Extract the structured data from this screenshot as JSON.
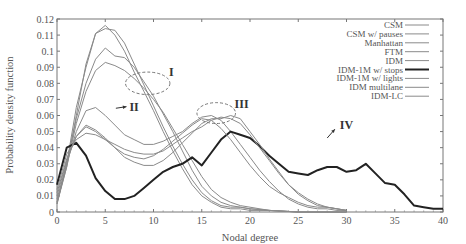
{
  "chart_data": {
    "type": "line",
    "title": "",
    "xlabel": "Nodal degree",
    "ylabel": "Probability density function",
    "xlim": [
      0,
      40
    ],
    "ylim": [
      0,
      0.12
    ],
    "xticks": [
      0,
      5,
      10,
      15,
      20,
      25,
      30,
      35,
      40
    ],
    "yticks": [
      0,
      0.01,
      0.02,
      0.03,
      0.04,
      0.05,
      0.06,
      0.07,
      0.08,
      0.09,
      0.1,
      0.11,
      0.12
    ],
    "xtick_labels": [
      "0",
      "5",
      "10",
      "15",
      "20",
      "25",
      "30",
      "35",
      "40"
    ],
    "ytick_labels": [
      "0",
      "0.01",
      "0.02",
      "0.03",
      "0.04",
      "0.05",
      "0.06",
      "0.07",
      "0.08",
      "0.09",
      "0.1",
      "0.11",
      "0.12"
    ],
    "grid": false,
    "legend_position": "upper right",
    "series": [
      {
        "name": "CSM",
        "color": "#8a8a8a",
        "width": 1,
        "x": [
          0,
          1,
          2,
          3,
          4,
          5,
          6,
          7,
          8,
          9,
          10,
          11,
          12,
          13,
          14,
          15,
          16,
          17,
          18,
          19,
          20,
          22,
          25,
          28,
          30
        ],
        "values": [
          0.005,
          0.03,
          0.065,
          0.09,
          0.111,
          0.116,
          0.11,
          0.1,
          0.087,
          0.075,
          0.063,
          0.05,
          0.038,
          0.027,
          0.017,
          0.01,
          0.006,
          0.003,
          0.002,
          0.002,
          0.001,
          0.001,
          0.0,
          0.0,
          0.0
        ]
      },
      {
        "name": "CSM w/ pauses",
        "color": "#8a8a8a",
        "width": 1,
        "x": [
          0,
          1,
          2,
          3,
          4,
          5,
          6,
          7,
          8,
          9,
          10,
          11,
          12,
          13,
          14,
          15,
          16,
          17,
          18,
          19,
          20,
          22,
          25,
          28,
          30
        ],
        "values": [
          0.005,
          0.028,
          0.06,
          0.092,
          0.111,
          0.114,
          0.113,
          0.105,
          0.092,
          0.079,
          0.066,
          0.053,
          0.041,
          0.03,
          0.02,
          0.012,
          0.007,
          0.004,
          0.003,
          0.003,
          0.002,
          0.001,
          0.0,
          0.0,
          0.0
        ]
      },
      {
        "name": "Manhattan",
        "color": "#8a8a8a",
        "width": 1,
        "x": [
          0,
          1,
          2,
          3,
          4,
          5,
          6,
          7,
          8,
          9,
          10,
          11,
          12,
          13,
          14,
          15,
          16,
          17,
          18,
          19,
          20,
          22,
          25,
          28,
          30
        ],
        "values": [
          0.006,
          0.03,
          0.058,
          0.08,
          0.095,
          0.102,
          0.097,
          0.096,
          0.09,
          0.081,
          0.072,
          0.061,
          0.05,
          0.038,
          0.026,
          0.016,
          0.01,
          0.006,
          0.004,
          0.003,
          0.002,
          0.001,
          0.0,
          0.0,
          0.0
        ]
      },
      {
        "name": "FTM",
        "color": "#8a8a8a",
        "width": 1,
        "x": [
          0,
          1,
          2,
          3,
          4,
          5,
          6,
          7,
          8,
          9,
          10,
          11,
          12,
          13,
          14,
          15,
          16,
          17,
          18,
          19,
          20,
          22,
          25,
          28,
          30
        ],
        "values": [
          0.006,
          0.028,
          0.055,
          0.075,
          0.088,
          0.093,
          0.091,
          0.088,
          0.083,
          0.077,
          0.07,
          0.062,
          0.052,
          0.042,
          0.032,
          0.022,
          0.014,
          0.009,
          0.006,
          0.004,
          0.003,
          0.001,
          0.0,
          0.0,
          0.0
        ]
      },
      {
        "name": "IDM",
        "color": "#8a8a8a",
        "width": 1,
        "x": [
          0,
          1,
          2,
          3,
          4,
          5,
          6,
          7,
          8,
          9,
          10,
          11,
          12,
          13,
          14,
          15,
          16,
          17,
          18,
          19,
          20,
          21,
          22,
          23,
          24,
          25,
          26,
          27,
          28,
          29,
          30
        ],
        "values": [
          0.008,
          0.03,
          0.05,
          0.063,
          0.065,
          0.06,
          0.054,
          0.048,
          0.045,
          0.042,
          0.042,
          0.044,
          0.047,
          0.05,
          0.055,
          0.059,
          0.06,
          0.057,
          0.05,
          0.042,
          0.034,
          0.026,
          0.019,
          0.013,
          0.008,
          0.005,
          0.003,
          0.002,
          0.002,
          0.001,
          0.001
        ]
      },
      {
        "name": "IDM-1M w/ stops",
        "color": "#222222",
        "width": 2,
        "x": [
          0,
          1,
          2,
          3,
          4,
          5,
          6,
          7,
          8,
          9,
          10,
          11,
          12,
          13,
          14,
          15,
          16,
          17,
          18,
          19,
          20,
          21,
          22,
          23,
          24,
          25,
          26,
          27,
          28,
          29,
          30,
          31,
          32,
          33,
          34,
          35,
          36,
          37,
          38,
          39,
          40
        ],
        "values": [
          0.017,
          0.04,
          0.043,
          0.035,
          0.021,
          0.013,
          0.008,
          0.008,
          0.01,
          0.015,
          0.02,
          0.025,
          0.028,
          0.03,
          0.034,
          0.029,
          0.037,
          0.045,
          0.05,
          0.048,
          0.046,
          0.041,
          0.035,
          0.03,
          0.025,
          0.024,
          0.023,
          0.026,
          0.028,
          0.028,
          0.025,
          0.026,
          0.03,
          0.024,
          0.018,
          0.017,
          0.011,
          0.004,
          0.003,
          0.002,
          0.002
        ]
      },
      {
        "name": "IDM-1M w/ lights",
        "color": "#8a8a8a",
        "width": 1,
        "x": [
          0,
          1,
          2,
          3,
          4,
          5,
          6,
          7,
          8,
          9,
          10,
          11,
          12,
          13,
          14,
          15,
          16,
          17,
          18,
          19,
          20,
          21,
          22,
          23,
          24,
          25,
          26,
          27,
          28,
          29,
          30
        ],
        "values": [
          0.01,
          0.032,
          0.047,
          0.053,
          0.05,
          0.045,
          0.04,
          0.036,
          0.034,
          0.033,
          0.035,
          0.039,
          0.044,
          0.049,
          0.054,
          0.058,
          0.057,
          0.052,
          0.045,
          0.037,
          0.029,
          0.022,
          0.016,
          0.012,
          0.009,
          0.006,
          0.004,
          0.003,
          0.003,
          0.002,
          0.001
        ]
      },
      {
        "name": "IDM multilane",
        "color": "#8a8a8a",
        "width": 1,
        "x": [
          0,
          1,
          2,
          3,
          4,
          5,
          6,
          7,
          8,
          9,
          10,
          11,
          12,
          13,
          14,
          15,
          16,
          17,
          18,
          19,
          20,
          21,
          22,
          23,
          24,
          25,
          26,
          27,
          28,
          29,
          30
        ],
        "values": [
          0.012,
          0.033,
          0.047,
          0.054,
          0.051,
          0.046,
          0.04,
          0.034,
          0.031,
          0.029,
          0.029,
          0.032,
          0.037,
          0.043,
          0.049,
          0.055,
          0.058,
          0.058,
          0.06,
          0.058,
          0.05,
          0.042,
          0.033,
          0.025,
          0.017,
          0.011,
          0.007,
          0.004,
          0.003,
          0.002,
          0.001
        ]
      },
      {
        "name": "IDM-LC",
        "color": "#8a8a8a",
        "width": 1,
        "x": [
          0,
          1,
          2,
          3,
          4,
          5,
          6,
          7,
          8,
          9,
          10,
          11,
          12,
          13,
          14,
          15,
          16,
          17,
          18,
          19,
          20,
          21,
          22,
          23,
          24,
          25,
          26,
          27,
          28,
          29,
          30
        ],
        "values": [
          0.014,
          0.036,
          0.045,
          0.049,
          0.048,
          0.045,
          0.042,
          0.039,
          0.037,
          0.036,
          0.036,
          0.038,
          0.042,
          0.046,
          0.05,
          0.053,
          0.057,
          0.059,
          0.058,
          0.055,
          0.048,
          0.04,
          0.032,
          0.024,
          0.017,
          0.012,
          0.008,
          0.005,
          0.003,
          0.002,
          0.001
        ]
      }
    ],
    "annotations": [
      {
        "label": "I",
        "x": 11.6,
        "y": 0.087,
        "ellipse": {
          "cx": 9.4,
          "cy": 0.08,
          "rx": 2.3,
          "ry": 0.007
        }
      },
      {
        "label": "II",
        "x": 7.5,
        "y": 0.0655,
        "arrow_from": [
          6.1,
          0.0645
        ],
        "arrow_to": [
          7.2,
          0.0655
        ]
      },
      {
        "label": "III",
        "x": 18.4,
        "y": 0.067,
        "ellipse": {
          "cx": 16.5,
          "cy": 0.0615,
          "rx": 2.0,
          "ry": 0.0065
        }
      },
      {
        "label": "IV",
        "x": 29.3,
        "y": 0.054,
        "arrow_from": [
          28.0,
          0.046
        ],
        "arrow_to": [
          28.8,
          0.0515
        ]
      }
    ]
  }
}
